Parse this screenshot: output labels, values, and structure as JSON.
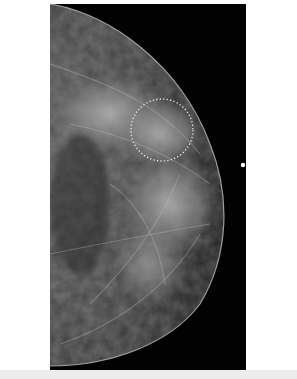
{
  "image": {
    "type": "mammogram",
    "view": "craniocaudal",
    "annotation": {
      "shape": "dotted-circle",
      "color": "#e8e8e8"
    },
    "marker": {
      "shape": "dot",
      "color": "#ffffff"
    }
  }
}
